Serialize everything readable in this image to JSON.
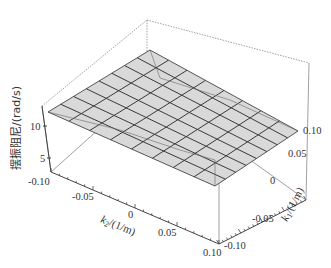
{
  "chart_data": {
    "type": "surface3d",
    "title": "",
    "zlabel": "摆振阻尼/(rad/s)",
    "xlabel": "k2/(1/m)",
    "ylabel": "k1/(1/m)",
    "x_ticks": [
      "-0.10",
      "-0.05",
      "0",
      "0.05",
      "0.10"
    ],
    "y_ticks": [
      "-0.10",
      "-0.05",
      "0",
      "0.05",
      "0.10"
    ],
    "z_ticks": [
      "5",
      "10"
    ],
    "xlim": [
      -0.1,
      0.1
    ],
    "ylim": [
      -0.1,
      0.1
    ],
    "zlim": [
      2,
      15
    ],
    "grid_size": [
      8,
      8
    ],
    "surface_description": "Nearly planar surface, z ≈ 12–14 rad/s, slightly tilted across the k1/k2 domain",
    "surface_color": "#d9d9d9",
    "mesh_color": "#333333"
  },
  "labels": {
    "z_axis": "摆振阻尼/(rad/s)",
    "x_axis_k": "k",
    "x_axis_sub": "2",
    "x_axis_unit": "/(1/m)",
    "y_axis_k": "k",
    "y_axis_sub": "1",
    "y_axis_unit": "/(1/m)",
    "z10": "10",
    "z5": "5",
    "xt0": "-0.10",
    "xt1": "-0.05",
    "xt2": "0",
    "xt3": "0.05",
    "xt4": "0.10",
    "yt0": "-0.10",
    "yt1": "-0.05",
    "yt2": "0",
    "yt3": "0.05",
    "yt4": "0.10"
  }
}
